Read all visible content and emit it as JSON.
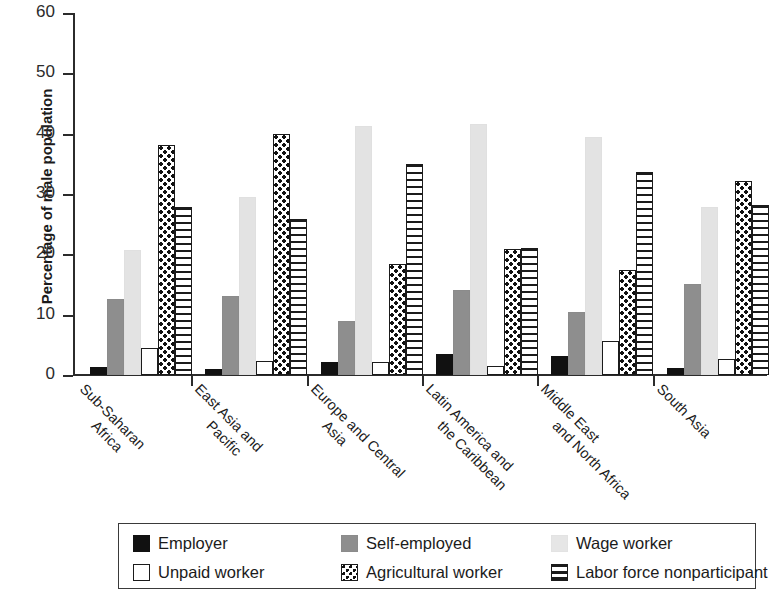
{
  "chart_data": {
    "type": "bar",
    "title": "",
    "xlabel": "",
    "ylabel": "Percentage of male population",
    "ylim": [
      0,
      60
    ],
    "yticks": [
      0,
      10,
      20,
      30,
      40,
      50,
      60
    ],
    "ytick_labels": [
      "0",
      "10",
      "20",
      "30",
      "40",
      "50",
      "60"
    ],
    "grid": false,
    "legend_position": "bottom",
    "categories": [
      "Sub-Saharan\nAfrica",
      "East Asia and\nPacific",
      "Europe and Central\nAsia",
      "Latin America and\nthe Caribbean",
      "Middle East\nand North Africa",
      "South Asia"
    ],
    "category_labels_flat": [
      "Sub-Saharan Africa",
      "East Asia and Pacific",
      "Europe and Central Asia",
      "Latin America and the Caribbean",
      "Middle East and North Africa",
      "South Asia"
    ],
    "series": [
      {
        "name": "Employer",
        "key": "employer",
        "style": "solid-black",
        "color": "#111111",
        "values": [
          1.3,
          1.0,
          2.1,
          3.5,
          3.2,
          1.2
        ]
      },
      {
        "name": "Self-employed",
        "key": "self",
        "style": "solid-gray",
        "color": "#8e8e8e",
        "values": [
          12.6,
          13.1,
          9.0,
          14.1,
          10.5,
          15.1
        ]
      },
      {
        "name": "Wage worker",
        "key": "wage",
        "style": "solid-light-gray",
        "color": "#e3e3e3",
        "values": [
          20.8,
          29.5,
          41.3,
          41.6,
          39.4,
          27.8
        ]
      },
      {
        "name": "Unpaid worker",
        "key": "unpaid",
        "style": "open-white",
        "color": "#ffffff",
        "values": [
          4.5,
          2.3,
          2.1,
          1.5,
          5.7,
          2.6
        ]
      },
      {
        "name": "Agricultural worker",
        "key": "agri",
        "style": "dotted",
        "color": "#ffffff",
        "values": [
          38.1,
          40.0,
          18.4,
          20.9,
          17.4,
          32.1
        ]
      },
      {
        "name": "Labor force nonparticipant",
        "key": "labor",
        "style": "horizontal-stripes",
        "color": "#ffffff",
        "values": [
          27.8,
          25.8,
          35.0,
          21.1,
          33.7,
          28.2
        ]
      }
    ]
  }
}
